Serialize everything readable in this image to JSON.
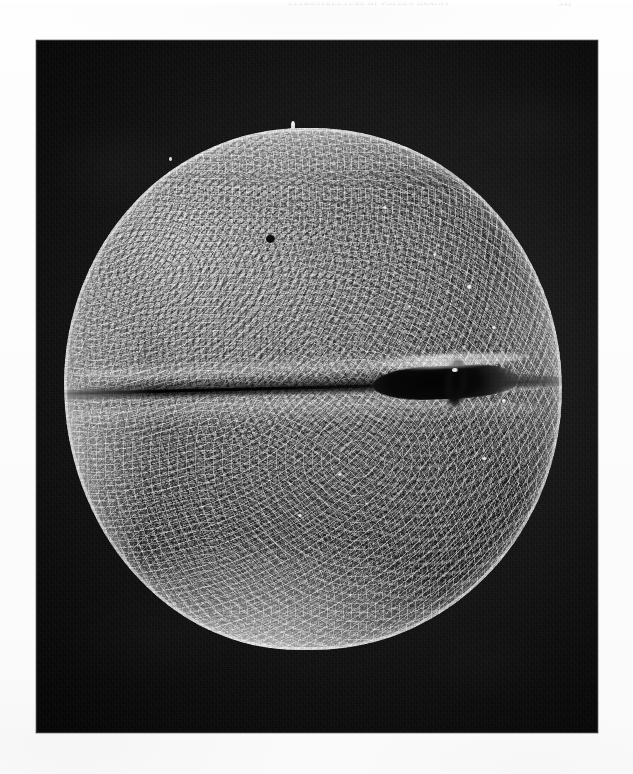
{
  "page": {
    "background_color": "#fdfdfd",
    "width": 633,
    "height": 774
  },
  "running_head": {
    "text": "ULTRASTRUCTURE OF POLLEN GRAINS",
    "page_number": "341",
    "visible": true,
    "note": "Faint small-caps running head, cropped by the top edge of the scan"
  },
  "plate": {
    "caption": "",
    "figure_label": "",
    "background_color": "#0d0d0d",
    "frame": {
      "left": 36,
      "top": 40,
      "width": 562,
      "height": 693
    }
  },
  "specimen": {
    "type": "scanning-electron-micrograph",
    "subject": "pollen grain",
    "shape": "spheroidal, bilobed in equatorial view",
    "surface_sculpture": "rugulate to verrucate, densely granular",
    "aperture_type": "single equatorial colpus with gaping os",
    "features": [
      {
        "name": "colpus",
        "description": "equatorial furrow crossing the grain from left margin to right"
      },
      {
        "name": "aperture",
        "description": "dark gaping opening in the right half of the colpus"
      },
      {
        "name": "margo",
        "description": "bright raised ridge bordering the furrow"
      },
      {
        "name": "polar-cap",
        "description": "smooth, brightly charged upper-left region"
      },
      {
        "name": "surface-pit",
        "description": "small dark pit on the upper-left shoulder"
      },
      {
        "name": "debris-particles",
        "description": "scattered bright mineral fragments on the right limb"
      },
      {
        "name": "edge-spike",
        "description": "bright projection on the upper silhouette"
      }
    ],
    "grayscale": {
      "background": "#121212",
      "shadow": "#3c3c3c",
      "midtone": "#7c7c7c",
      "highlight": "#eaeaea"
    }
  }
}
